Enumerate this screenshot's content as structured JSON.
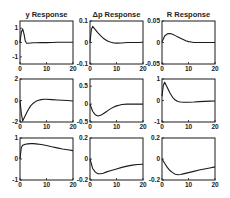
{
  "figure": {
    "columns": [
      "y Response",
      "Δp Response",
      "R Response"
    ],
    "column_vars": [
      "y",
      "Δp",
      "R"
    ]
  },
  "chart_data": [
    {
      "type": "line",
      "row": 0,
      "col": 0,
      "title": "y Response",
      "xlabel": "",
      "ylabel": "",
      "xlim": [
        0,
        20
      ],
      "ylim": [
        -1.5,
        1.5
      ],
      "xticks": [
        "0",
        "10",
        "20"
      ],
      "yticks": [
        "1",
        "0",
        "-1"
      ],
      "ytick_values": [
        1,
        0,
        -1
      ],
      "series": [
        {
          "name": "response",
          "x": [
            0,
            0.5,
            1,
            1.5,
            2,
            2.5,
            3,
            4,
            5,
            6,
            8,
            10,
            12,
            14,
            16,
            18,
            20
          ],
          "values": [
            0,
            0.7,
            0.95,
            0.6,
            0.1,
            -0.05,
            -0.05,
            -0.03,
            -0.02,
            -0.02,
            -0.01,
            -0.01,
            0,
            0.02,
            0.02,
            0.02,
            0.02
          ]
        }
      ]
    },
    {
      "type": "line",
      "row": 0,
      "col": 1,
      "title": "Δp Response",
      "xlabel": "",
      "ylabel": "",
      "xlim": [
        0,
        20
      ],
      "ylim": [
        -0.1,
        0.1
      ],
      "xticks": [
        "0",
        "10",
        "20"
      ],
      "yticks": [
        "0.1",
        "0",
        "-0.1"
      ],
      "ytick_values": [
        0.1,
        0,
        -0.1
      ],
      "series": [
        {
          "name": "response",
          "x": [
            0,
            0.5,
            1,
            2,
            3,
            4,
            5,
            6,
            7,
            8,
            9,
            10,
            12,
            14,
            16,
            18,
            20
          ],
          "values": [
            0,
            0.06,
            0.075,
            0.06,
            0.045,
            0.032,
            0.02,
            0.012,
            0.005,
            0.001,
            -0.002,
            -0.003,
            -0.002,
            0,
            0,
            0,
            0.001
          ]
        }
      ]
    },
    {
      "type": "line",
      "row": 0,
      "col": 2,
      "title": "R Response",
      "xlabel": "",
      "ylabel": "",
      "xlim": [
        0,
        20
      ],
      "ylim": [
        -0.05,
        0.05
      ],
      "xticks": [
        "0",
        "10",
        "20"
      ],
      "yticks": [
        "0.05",
        "0",
        "-0.05"
      ],
      "ytick_values": [
        0.05,
        0,
        -0.05
      ],
      "series": [
        {
          "name": "response",
          "x": [
            0,
            1,
            2,
            3,
            4,
            5,
            6,
            7,
            8,
            9,
            10,
            11,
            12,
            14,
            16,
            18,
            20
          ],
          "values": [
            0.002,
            0.015,
            0.02,
            0.021,
            0.019,
            0.016,
            0.013,
            0.01,
            0.007,
            0.004,
            0.002,
            0.001,
            0,
            0,
            0,
            0,
            0
          ]
        }
      ]
    },
    {
      "type": "line",
      "row": 1,
      "col": 0,
      "title": "",
      "xlabel": "",
      "ylabel": "",
      "xlim": [
        0,
        20
      ],
      "ylim": [
        -2,
        2
      ],
      "xticks": [
        "0",
        "10",
        "20"
      ],
      "yticks": [
        "2",
        "0",
        "-2"
      ],
      "ytick_values": [
        2,
        0,
        -2
      ],
      "series": [
        {
          "name": "response",
          "x": [
            0,
            0.5,
            1,
            2,
            3,
            4,
            5,
            6,
            7,
            8,
            9,
            10,
            12,
            14,
            16,
            18,
            20
          ],
          "values": [
            0,
            -1.2,
            -1.9,
            -1.4,
            -0.9,
            -0.5,
            -0.25,
            -0.08,
            0.02,
            0.08,
            0.12,
            0.12,
            0.08,
            0.05,
            0.03,
            0,
            -0.05
          ]
        }
      ]
    },
    {
      "type": "line",
      "row": 1,
      "col": 1,
      "title": "",
      "xlabel": "",
      "ylabel": "",
      "xlim": [
        0,
        20
      ],
      "ylim": [
        -0.5,
        0.7
      ],
      "xticks": [
        "0",
        "10",
        "20"
      ],
      "yticks": [
        "0.5",
        "0",
        "-0.5"
      ],
      "ytick_values": [
        0.5,
        0,
        -0.5
      ],
      "series": [
        {
          "name": "response",
          "x": [
            0,
            1,
            2,
            3,
            4,
            5,
            6,
            7,
            8,
            9,
            10,
            11,
            12,
            14,
            16,
            18,
            20
          ],
          "values": [
            0,
            -0.2,
            -0.3,
            -0.33,
            -0.31,
            -0.27,
            -0.22,
            -0.17,
            -0.12,
            -0.08,
            -0.05,
            -0.03,
            -0.01,
            0,
            0,
            0,
            0
          ]
        }
      ]
    },
    {
      "type": "line",
      "row": 1,
      "col": 2,
      "title": "",
      "xlabel": "",
      "ylabel": "",
      "xlim": [
        0,
        20
      ],
      "ylim": [
        -1,
        1
      ],
      "xticks": [
        "0",
        "10",
        "20"
      ],
      "yticks": [
        "1",
        "0",
        "-1"
      ],
      "ytick_values": [
        1,
        0,
        -1
      ],
      "series": [
        {
          "name": "response",
          "x": [
            0,
            0.5,
            1,
            2,
            3,
            4,
            5,
            6,
            7,
            8,
            10,
            12,
            14,
            16,
            18,
            20
          ],
          "values": [
            0.2,
            0.7,
            0.85,
            0.6,
            0.35,
            0.15,
            0.02,
            -0.05,
            -0.07,
            -0.08,
            -0.08,
            -0.07,
            -0.05,
            -0.04,
            -0.03,
            -0.02
          ]
        }
      ]
    },
    {
      "type": "line",
      "row": 2,
      "col": 0,
      "title": "",
      "xlabel": "",
      "ylabel": "",
      "xlim": [
        0,
        20
      ],
      "ylim": [
        -1,
        1
      ],
      "xticks": [
        "0",
        "10",
        "20"
      ],
      "yticks": [
        "1",
        "0",
        "-1"
      ],
      "ytick_values": [
        1,
        0,
        -1
      ],
      "series": [
        {
          "name": "response",
          "x": [
            0,
            0.5,
            1,
            2,
            3,
            4,
            5,
            6,
            8,
            10,
            12,
            14,
            16,
            18,
            20
          ],
          "values": [
            0,
            0.55,
            0.65,
            0.7,
            0.72,
            0.73,
            0.73,
            0.72,
            0.69,
            0.64,
            0.58,
            0.53,
            0.48,
            0.44,
            0.4
          ]
        }
      ]
    },
    {
      "type": "line",
      "row": 2,
      "col": 1,
      "title": "",
      "xlabel": "",
      "ylabel": "",
      "xlim": [
        0,
        20
      ],
      "ylim": [
        -0.2,
        0.2
      ],
      "xticks": [
        "0",
        "10",
        "20"
      ],
      "yticks": [
        "0.2",
        "0",
        "-0.2"
      ],
      "ytick_values": [
        0.2,
        0,
        -0.2
      ],
      "series": [
        {
          "name": "response",
          "x": [
            0,
            1,
            2,
            3,
            4,
            5,
            6,
            8,
            10,
            12,
            14,
            16,
            18,
            20
          ],
          "values": [
            0,
            -0.09,
            -0.125,
            -0.14,
            -0.14,
            -0.135,
            -0.125,
            -0.11,
            -0.095,
            -0.08,
            -0.068,
            -0.058,
            -0.052,
            -0.05
          ]
        }
      ]
    },
    {
      "type": "line",
      "row": 2,
      "col": 2,
      "title": "",
      "xlabel": "",
      "ylabel": "",
      "xlim": [
        0,
        20
      ],
      "ylim": [
        -0.2,
        0.2
      ],
      "xticks": [
        "0",
        "10",
        "20"
      ],
      "yticks": [
        "0.2",
        "0",
        "-0.2"
      ],
      "ytick_values": [
        0.2,
        0,
        -0.2
      ],
      "series": [
        {
          "name": "response",
          "x": [
            0,
            1,
            2,
            3,
            4,
            5,
            6,
            7,
            8,
            10,
            12,
            14,
            16,
            18,
            20
          ],
          "values": [
            0,
            -0.04,
            -0.08,
            -0.11,
            -0.13,
            -0.145,
            -0.15,
            -0.148,
            -0.142,
            -0.13,
            -0.118,
            -0.105,
            -0.095,
            -0.085,
            -0.075
          ]
        }
      ]
    }
  ],
  "style": {
    "line_color": "#1a1a1a",
    "axes_color": "#1a1a1a",
    "background": "#ffffff"
  }
}
